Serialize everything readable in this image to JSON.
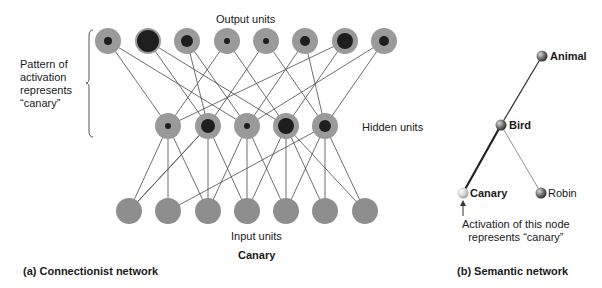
{
  "connectionist": {
    "output_label": "Output units",
    "hidden_label": "Hidden units",
    "input_label": "Input units",
    "input_word": "Canary",
    "pattern_label_lines": [
      "Pattern of",
      "activation",
      "represents",
      "“canary”"
    ],
    "caption": "(a) Connectionist network",
    "output_units": [
      {
        "x": 108,
        "core": 4
      },
      {
        "x": 148,
        "core": 11
      },
      {
        "x": 187,
        "core": 6
      },
      {
        "x": 227,
        "core": 3
      },
      {
        "x": 266,
        "core": 3
      },
      {
        "x": 305,
        "core": 5
      },
      {
        "x": 345,
        "core": 8
      },
      {
        "x": 384,
        "core": 5
      }
    ],
    "hidden_units": [
      {
        "x": 168,
        "core": 3
      },
      {
        "x": 208,
        "core": 7
      },
      {
        "x": 247,
        "core": 3
      },
      {
        "x": 286,
        "core": 8
      },
      {
        "x": 325,
        "core": 6
      }
    ],
    "input_units": [
      129,
      168,
      208,
      247,
      286,
      325,
      365
    ],
    "colors": {
      "unit_fill": "#9a9a9a",
      "unit_core": "#1e1e1e",
      "line": "#4a4a4a"
    }
  },
  "semantic": {
    "nodes": [
      {
        "id": "animal",
        "label": "Animal",
        "x": 542,
        "y": 56,
        "fill": "#6a6a6a"
      },
      {
        "id": "bird",
        "label": "Bird",
        "x": 501,
        "y": 125,
        "fill": "#6a6a6a"
      },
      {
        "id": "canary",
        "label": "Canary",
        "x": 463,
        "y": 193,
        "fill": "#cfcfcf"
      },
      {
        "id": "robin",
        "label": "Robin",
        "x": 541,
        "y": 193,
        "fill": "#6a6a6a"
      }
    ],
    "annotation_lines": [
      "Activation of this node",
      "represents “canary”"
    ],
    "caption": "(b) Semantic network"
  }
}
